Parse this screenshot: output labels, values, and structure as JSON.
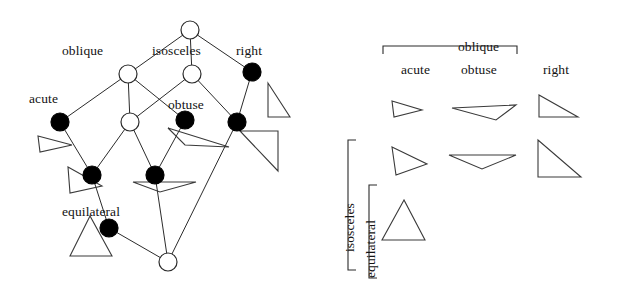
{
  "figure": {
    "background_color": "#ffffff",
    "line_color": "#2b2b2b",
    "node_filled_color": "#000000",
    "node_open_color": "#ffffff"
  },
  "lattice": {
    "labels": [
      {
        "id": "oblique",
        "text": "oblique",
        "x": 62,
        "y": 44
      },
      {
        "id": "isosceles",
        "text": "isosceles",
        "x": 152,
        "y": 44
      },
      {
        "id": "right",
        "text": "right",
        "x": 236,
        "y": 44
      },
      {
        "id": "acute",
        "text": "acute",
        "x": 29,
        "y": 92
      },
      {
        "id": "obtuse",
        "text": "obtuse",
        "x": 168,
        "y": 98
      },
      {
        "id": "equilateral",
        "text": "equilateral",
        "x": 62,
        "y": 205
      }
    ],
    "nodes": [
      {
        "id": "top",
        "x": 190,
        "y": 30,
        "r": 9,
        "fill": "open"
      },
      {
        "id": "oblique",
        "x": 128,
        "y": 74,
        "r": 9,
        "fill": "open"
      },
      {
        "id": "isosceles",
        "x": 192,
        "y": 74,
        "r": 9,
        "fill": "open"
      },
      {
        "id": "right",
        "x": 252,
        "y": 72,
        "r": 9,
        "fill": "filled"
      },
      {
        "id": "acute",
        "x": 60,
        "y": 122,
        "r": 9,
        "fill": "filled"
      },
      {
        "id": "oblq-isos",
        "x": 130,
        "y": 122,
        "r": 9,
        "fill": "open"
      },
      {
        "id": "obtuse",
        "x": 185,
        "y": 120,
        "r": 9,
        "fill": "filled"
      },
      {
        "id": "right-isos",
        "x": 237,
        "y": 122,
        "r": 9,
        "fill": "filled"
      },
      {
        "id": "acute-isos",
        "x": 92,
        "y": 175,
        "r": 9,
        "fill": "filled"
      },
      {
        "id": "obtuse-isos",
        "x": 155,
        "y": 175,
        "r": 9,
        "fill": "filled"
      },
      {
        "id": "equilateral",
        "x": 109,
        "y": 228,
        "r": 9,
        "fill": "filled"
      },
      {
        "id": "bottom",
        "x": 168,
        "y": 262,
        "r": 9,
        "fill": "open"
      }
    ],
    "edges": [
      {
        "from": "top",
        "to": "oblique"
      },
      {
        "from": "top",
        "to": "isosceles"
      },
      {
        "from": "top",
        "to": "right"
      },
      {
        "from": "oblique",
        "to": "acute"
      },
      {
        "from": "oblique",
        "to": "oblq-isos"
      },
      {
        "from": "oblique",
        "to": "obtuse"
      },
      {
        "from": "isosceles",
        "to": "oblq-isos"
      },
      {
        "from": "isosceles",
        "to": "right-isos"
      },
      {
        "from": "right",
        "to": "right-isos"
      },
      {
        "from": "acute",
        "to": "acute-isos"
      },
      {
        "from": "oblq-isos",
        "to": "acute-isos"
      },
      {
        "from": "oblq-isos",
        "to": "obtuse-isos"
      },
      {
        "from": "obtuse",
        "to": "obtuse-isos"
      },
      {
        "from": "acute-isos",
        "to": "equilateral"
      },
      {
        "from": "obtuse-isos",
        "to": "bottom"
      },
      {
        "from": "right-isos",
        "to": "bottom"
      },
      {
        "from": "equilateral",
        "to": "bottom"
      }
    ],
    "example_triangles": [
      {
        "id": "acute-scalene-example",
        "points": "38,136 72,145 40,152",
        "near_node": "acute"
      },
      {
        "id": "obtuse-scalene-example",
        "points": "168,128 229,147 185,145",
        "near_node": "obtuse"
      },
      {
        "id": "right-scalene-example",
        "points": "268,83 268,117 290,117",
        "near_node": "right"
      },
      {
        "id": "right-isosceles-example",
        "points": "240,131 278,131 278,171",
        "near_node": "right-isos"
      },
      {
        "id": "acute-isosceles-example",
        "points": "68,167 102,186 70,193",
        "near_node": "acute-isos"
      },
      {
        "id": "obtuse-isosceles-example",
        "points": "133,182 196,182 160,192",
        "near_node": "obtuse-isos"
      },
      {
        "id": "equilateral-example",
        "points": "90,216 70,256 112,256",
        "near_node": "equilateral"
      }
    ]
  },
  "grid": {
    "column_group_label": {
      "text": "oblique",
      "x": 458,
      "y": 40
    },
    "column_headers": [
      {
        "id": "acute",
        "text": "acute",
        "x": 401,
        "y": 63
      },
      {
        "id": "obtuse",
        "text": "obtuse",
        "x": 461,
        "y": 63
      },
      {
        "id": "right",
        "text": "right",
        "x": 543,
        "y": 63
      }
    ],
    "row_group_label": {
      "text": "isosceles",
      "x": 343,
      "y": 252
    },
    "row_sub_label": {
      "text": "equilateral",
      "x": 364,
      "y": 278
    },
    "cells": [
      {
        "row": "scalene",
        "col": "acute",
        "shape": "acute-scalene",
        "points": "392,101 422,110 394,117"
      },
      {
        "row": "scalene",
        "col": "obtuse",
        "shape": "obtuse-scalene",
        "points": "452,108 516,105 496,120"
      },
      {
        "row": "scalene",
        "col": "right",
        "shape": "right-scalene",
        "points": "539,95 539,117 578,117"
      },
      {
        "row": "isosceles",
        "col": "acute",
        "shape": "acute-isosceles",
        "points": "392,147 427,164 396,175"
      },
      {
        "row": "isosceles",
        "col": "obtuse",
        "shape": "obtuse-isosceles",
        "points": "449,155 516,155 482,169"
      },
      {
        "row": "isosceles",
        "col": "right",
        "shape": "right-isosceles",
        "points": "538,140 538,177 581,177"
      },
      {
        "row": "equilateral",
        "col": "acute",
        "shape": "equilateral",
        "points": "404,200 382,240 425,240"
      }
    ],
    "column_bracket": {
      "x1": 383,
      "x2": 517,
      "y": 46,
      "tick": 8
    },
    "row_bracket_outer": {
      "y1": 140,
      "y2": 270,
      "x": 348,
      "tick": 8
    },
    "row_bracket_inner": {
      "y1": 185,
      "y2": 278,
      "x": 369,
      "tick": 8
    }
  }
}
